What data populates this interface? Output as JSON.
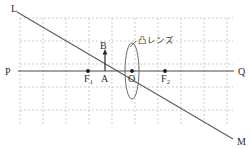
{
  "figure": {
    "kind": "optics-ray-diagram",
    "title_text": "",
    "background_color": "#ffffff",
    "width": 251,
    "height": 149
  },
  "colors": {
    "grid": "#b9b9b9",
    "axis": "#4a4a4a",
    "ray": "#5a5a5a",
    "lens": "#6a6a6a",
    "object_arrow": "#2b2b2b",
    "label": "#2b2b2b",
    "label_jp": "#3a3a3a",
    "point": "#1a1a1a"
  },
  "grid": {
    "visible": true,
    "style": "dashed",
    "left": 20,
    "top": 18,
    "right": 233,
    "bottom": 125,
    "cell_size": 23,
    "columns": 10,
    "rows": 5
  },
  "axis": {
    "name": "optical-axis",
    "y": 71,
    "x_start": 18,
    "x_end": 234,
    "left_label": "P",
    "right_label": "Q"
  },
  "ray": {
    "name": "ray-line-LM",
    "start_label": "L",
    "end_label": "M",
    "x1": 17,
    "y1": 12,
    "x2": 233,
    "y2": 139
  },
  "lens": {
    "name": "convex-lens",
    "label": "凸レンズ",
    "center_x": 132,
    "center_y": 71,
    "half_width": 7,
    "half_height": 28,
    "leader_from_x": 136,
    "leader_from_y": 41,
    "leader_to_x": 130,
    "leader_to_y": 47
  },
  "points": [
    {
      "id": "F1",
      "label": "F",
      "subscript": "1",
      "x": 88,
      "y": 71,
      "dot": true,
      "label_x": 84,
      "label_y": 82
    },
    {
      "id": "A",
      "label": "A",
      "subscript": "",
      "x": 105,
      "y": 71,
      "dot": false,
      "label_x": 101,
      "label_y": 82
    },
    {
      "id": "O",
      "label": "O",
      "subscript": "",
      "x": 132,
      "y": 71,
      "dot": true,
      "label_x": 128,
      "label_y": 82
    },
    {
      "id": "F2",
      "label": "F",
      "subscript": "2",
      "x": 165,
      "y": 71,
      "dot": true,
      "label_x": 161,
      "label_y": 82
    },
    {
      "id": "B",
      "label": "B",
      "subscript": "",
      "x": 105,
      "y": 52,
      "dot": false,
      "label_x": 100,
      "label_y": 49
    }
  ],
  "object_arrow": {
    "name": "object-arrow-AB",
    "base_x": 105,
    "base_y": 71,
    "tip_x": 105,
    "tip_y": 53,
    "from_point": "A",
    "to_point": "B"
  },
  "endpoint_labels": [
    {
      "id": "L",
      "text": "L",
      "x": 11,
      "y": 12
    },
    {
      "id": "P",
      "text": "P",
      "x": 5,
      "y": 75
    },
    {
      "id": "Q",
      "text": "Q",
      "x": 238,
      "y": 75
    },
    {
      "id": "M",
      "text": "M",
      "x": 237,
      "y": 145
    }
  ]
}
